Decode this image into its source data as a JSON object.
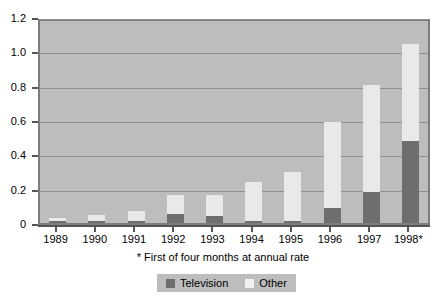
{
  "chart_data": {
    "type": "bar",
    "stacked": true,
    "title": "",
    "subtitle": "",
    "xlabel": "",
    "ylabel": "",
    "categories": [
      "1989",
      "1990",
      "1991",
      "1992",
      "1993",
      "1994",
      "1995",
      "1996",
      "1997",
      "1998*"
    ],
    "series": [
      {
        "name": "Television",
        "color": "#6e6e6e",
        "values": [
          0.005,
          0.005,
          0.005,
          0.05,
          0.04,
          0.012,
          0.012,
          0.09,
          0.18,
          0.48
        ]
      },
      {
        "name": "Other",
        "color": "#e9e9e9",
        "values": [
          0.015,
          0.035,
          0.06,
          0.11,
          0.12,
          0.228,
          0.288,
          0.5,
          0.625,
          0.565
        ]
      }
    ],
    "totals": [
      0.02,
      0.04,
      0.065,
      0.16,
      0.16,
      0.24,
      0.3,
      0.59,
      0.805,
      1.045
    ],
    "ylim": [
      0,
      1.2
    ],
    "yticks": [
      "0",
      "0.2",
      "0.4",
      "0.6",
      "0.8",
      "1.0",
      "1.2"
    ],
    "ytick_values": [
      0,
      0.2,
      0.4,
      0.6,
      0.8,
      1.0,
      1.2
    ],
    "grid": true,
    "legend_position": "bottom-center",
    "footnote": "* First of four months at annual rate",
    "plot_background": "#bdbdbd",
    "page_background": "#ffffff"
  },
  "legend": {
    "items": [
      {
        "label": "Television",
        "color": "#6e6e6e"
      },
      {
        "label": "Other",
        "color": "#f2f2f2"
      }
    ]
  },
  "footnote": "* First of four months at annual rate"
}
